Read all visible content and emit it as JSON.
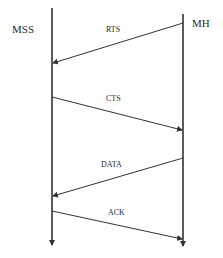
{
  "diagram": {
    "type": "sequence",
    "nodes": [
      {
        "id": "MSS",
        "label": "MSS",
        "x": 52
      },
      {
        "id": "MH",
        "label": "MH",
        "x": 183
      }
    ],
    "messages": [
      {
        "label": "RTS",
        "from": "MH",
        "to": "MSS",
        "y_from": 23,
        "y_to": 63
      },
      {
        "label": "CTS",
        "from": "MSS",
        "to": "MH",
        "y_from": 97,
        "y_to": 130
      },
      {
        "label": "DATA",
        "from": "MH",
        "to": "MSS",
        "y_from": 158,
        "y_to": 196
      },
      {
        "label": "ACK",
        "from": "MSS",
        "to": "MH",
        "y_from": 211,
        "y_to": 239
      }
    ],
    "line_color": "#333333"
  }
}
